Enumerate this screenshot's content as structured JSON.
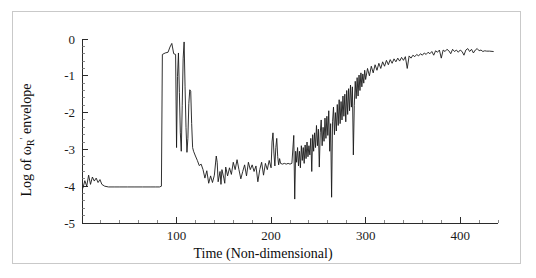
{
  "chart_data": {
    "type": "line",
    "title": "",
    "xlabel": "Time (Non-dimensional)",
    "ylabel": "Log of ωR' envelope",
    "ylabel_parts": {
      "prefix": "Log of ",
      "symbol": "ω",
      "subscript": "R",
      "prime": "'",
      "suffix": " envelope"
    },
    "xlim": [
      0,
      440
    ],
    "ylim": [
      -5,
      0
    ],
    "xticks": [
      100,
      200,
      300,
      400
    ],
    "xticklabels": [
      "100",
      "200",
      "300",
      "400"
    ],
    "yticks": [
      0,
      -1,
      -2,
      -3,
      -4,
      -5
    ],
    "yticklabels": [
      "0",
      "-1",
      "-2",
      "-3",
      "-4",
      "-5"
    ],
    "x_minor_step": 20,
    "y_minor_step": 0.2,
    "grid": false,
    "legend": null,
    "line_color": "#1a1a1a",
    "series": [
      {
        "name": "Log of omega_R prime envelope",
        "points": [
          [
            1,
            -4.05
          ],
          [
            3,
            -3.85
          ],
          [
            5,
            -4.0
          ],
          [
            7,
            -3.7
          ],
          [
            9,
            -3.95
          ],
          [
            11,
            -3.75
          ],
          [
            13,
            -3.86
          ],
          [
            15,
            -3.78
          ],
          [
            17,
            -3.9
          ],
          [
            19,
            -3.82
          ],
          [
            21,
            -3.95
          ],
          [
            24,
            -4.0
          ],
          [
            28,
            -4.02
          ],
          [
            34,
            -4.02
          ],
          [
            40,
            -4.02
          ],
          [
            48,
            -4.02
          ],
          [
            56,
            -4.02
          ],
          [
            64,
            -4.02
          ],
          [
            72,
            -4.02
          ],
          [
            78,
            -4.02
          ],
          [
            82,
            -4.02
          ],
          [
            84,
            -4.0
          ],
          [
            85,
            -0.42
          ],
          [
            88,
            -0.38
          ],
          [
            91,
            -0.36
          ],
          [
            93,
            -0.22
          ],
          [
            95,
            -0.12
          ],
          [
            97,
            -0.4
          ],
          [
            99,
            -0.42
          ],
          [
            100,
            -2.95
          ],
          [
            101,
            -1.02
          ],
          [
            102,
            -0.38
          ],
          [
            103,
            -1.45
          ],
          [
            104,
            -2.55
          ],
          [
            105,
            -3.05
          ],
          [
            106,
            -1.8
          ],
          [
            107,
            -0.52
          ],
          [
            108,
            -0.08
          ],
          [
            109,
            -1.3
          ],
          [
            110,
            -2.4
          ],
          [
            111,
            -3.08
          ],
          [
            112,
            -2.7
          ],
          [
            113,
            -1.75
          ],
          [
            114,
            -1.38
          ],
          [
            115,
            -1.42
          ],
          [
            116,
            -2.3
          ],
          [
            117,
            -2.95
          ],
          [
            118,
            -3.05
          ],
          [
            120,
            -3.18
          ],
          [
            122,
            -3.3
          ],
          [
            124,
            -3.44
          ],
          [
            126,
            -3.4
          ],
          [
            128,
            -3.55
          ],
          [
            130,
            -3.78
          ],
          [
            132,
            -3.58
          ],
          [
            134,
            -3.92
          ],
          [
            136,
            -3.72
          ],
          [
            138,
            -3.9
          ],
          [
            140,
            -3.7
          ],
          [
            142,
            -3.18
          ],
          [
            143,
            -3.35
          ],
          [
            144,
            -3.88
          ],
          [
            146,
            -3.6
          ],
          [
            147,
            -3.95
          ],
          [
            148,
            -3.55
          ],
          [
            150,
            -3.78
          ],
          [
            151,
            -3.92
          ],
          [
            152,
            -3.48
          ],
          [
            154,
            -3.72
          ],
          [
            156,
            -3.5
          ],
          [
            158,
            -3.68
          ],
          [
            160,
            -3.35
          ],
          [
            162,
            -3.55
          ],
          [
            164,
            -3.28
          ],
          [
            166,
            -3.55
          ],
          [
            168,
            -3.8
          ],
          [
            170,
            -3.6
          ],
          [
            172,
            -3.42
          ],
          [
            174,
            -3.72
          ],
          [
            176,
            -3.35
          ],
          [
            178,
            -3.55
          ],
          [
            180,
            -3.42
          ],
          [
            182,
            -3.6
          ],
          [
            184,
            -3.45
          ],
          [
            186,
            -3.88
          ],
          [
            188,
            -3.55
          ],
          [
            190,
            -3.35
          ],
          [
            192,
            -3.7
          ],
          [
            194,
            -3.38
          ],
          [
            196,
            -3.55
          ],
          [
            198,
            -3.3
          ],
          [
            200,
            -3.5
          ],
          [
            201,
            -2.8
          ],
          [
            202,
            -2.55
          ],
          [
            203,
            -3.1
          ],
          [
            204,
            -3.45
          ],
          [
            205,
            -2.95
          ],
          [
            206,
            -2.7
          ],
          [
            207,
            -3.2
          ],
          [
            208,
            -3.42
          ],
          [
            209,
            -3.25
          ],
          [
            210,
            -3.38
          ],
          [
            212,
            -3.4
          ],
          [
            214,
            -3.38
          ],
          [
            216,
            -3.4
          ],
          [
            218,
            -3.38
          ],
          [
            220,
            -3.4
          ],
          [
            222,
            -3.38
          ],
          [
            224,
            -2.62
          ],
          [
            225,
            -4.35
          ],
          [
            226,
            -3.05
          ],
          [
            227,
            -3.35
          ],
          [
            228,
            -2.95
          ],
          [
            229,
            -3.45
          ],
          [
            230,
            -3.05
          ],
          [
            231,
            -3.5
          ],
          [
            232,
            -2.9
          ],
          [
            233,
            -3.3
          ],
          [
            234,
            -2.95
          ],
          [
            235,
            -3.38
          ],
          [
            236,
            -2.88
          ],
          [
            237,
            -3.25
          ],
          [
            238,
            -2.8
          ],
          [
            239,
            -3.2
          ],
          [
            240,
            -2.9
          ],
          [
            241,
            -3.15
          ],
          [
            242,
            -2.7
          ],
          [
            243,
            -3.6
          ],
          [
            244,
            -2.6
          ],
          [
            245,
            -3.05
          ],
          [
            246,
            -2.55
          ],
          [
            247,
            -2.95
          ],
          [
            248,
            -2.35
          ],
          [
            249,
            -2.9
          ],
          [
            250,
            -2.45
          ],
          [
            251,
            -3.48
          ],
          [
            252,
            -2.55
          ],
          [
            253,
            -2.2
          ],
          [
            254,
            -2.9
          ],
          [
            255,
            -2.4
          ],
          [
            256,
            -2.78
          ],
          [
            257,
            -2.15
          ],
          [
            258,
            -2.7
          ],
          [
            259,
            -2.1
          ],
          [
            260,
            -2.62
          ],
          [
            261,
            -1.95
          ],
          [
            262,
            -3.05
          ],
          [
            263,
            -2.3
          ],
          [
            264,
            -4.3
          ],
          [
            265,
            -2.25
          ],
          [
            266,
            -1.85
          ],
          [
            267,
            -2.6
          ],
          [
            268,
            -2.0
          ],
          [
            269,
            -2.5
          ],
          [
            270,
            -1.78
          ],
          [
            271,
            -2.35
          ],
          [
            272,
            -1.65
          ],
          [
            273,
            -2.3
          ],
          [
            274,
            -1.7
          ],
          [
            275,
            -2.2
          ],
          [
            276,
            -1.55
          ],
          [
            277,
            -2.1
          ],
          [
            278,
            -1.5
          ],
          [
            279,
            -2.25
          ],
          [
            280,
            -1.4
          ],
          [
            281,
            -2.05
          ],
          [
            282,
            -1.35
          ],
          [
            283,
            -1.95
          ],
          [
            284,
            -1.25
          ],
          [
            285,
            -1.85
          ],
          [
            286,
            -1.3
          ],
          [
            287,
            -3.15
          ],
          [
            288,
            -1.8
          ],
          [
            289,
            -1.15
          ],
          [
            290,
            -1.62
          ],
          [
            291,
            -1.05
          ],
          [
            292,
            -1.55
          ],
          [
            293,
            -0.98
          ],
          [
            294,
            -1.4
          ],
          [
            295,
            -0.92
          ],
          [
            296,
            -1.3
          ],
          [
            297,
            -0.95
          ],
          [
            298,
            -1.2
          ],
          [
            299,
            -0.85
          ],
          [
            300,
            -1.1
          ],
          [
            302,
            -0.8
          ],
          [
            304,
            -1.0
          ],
          [
            306,
            -0.74
          ],
          [
            308,
            -0.92
          ],
          [
            310,
            -0.7
          ],
          [
            312,
            -0.85
          ],
          [
            314,
            -0.66
          ],
          [
            316,
            -0.8
          ],
          [
            318,
            -0.62
          ],
          [
            320,
            -0.74
          ],
          [
            322,
            -0.58
          ],
          [
            324,
            -0.7
          ],
          [
            326,
            -0.56
          ],
          [
            328,
            -0.66
          ],
          [
            330,
            -0.54
          ],
          [
            332,
            -0.62
          ],
          [
            334,
            -0.52
          ],
          [
            336,
            -0.6
          ],
          [
            338,
            -0.5
          ],
          [
            340,
            -0.58
          ],
          [
            342,
            -0.48
          ],
          [
            344,
            -0.8
          ],
          [
            346,
            -0.46
          ],
          [
            348,
            -0.52
          ],
          [
            350,
            -0.44
          ],
          [
            352,
            -0.48
          ],
          [
            354,
            -0.42
          ],
          [
            356,
            -0.46
          ],
          [
            358,
            -0.4
          ],
          [
            360,
            -0.44
          ],
          [
            362,
            -0.38
          ],
          [
            364,
            -0.42
          ],
          [
            366,
            -0.36
          ],
          [
            368,
            -0.4
          ],
          [
            370,
            -0.34
          ],
          [
            372,
            -0.44
          ],
          [
            374,
            -0.32
          ],
          [
            376,
            -0.36
          ],
          [
            378,
            -0.3
          ],
          [
            380,
            -0.52
          ],
          [
            382,
            -0.3
          ],
          [
            384,
            -0.34
          ],
          [
            386,
            -0.28
          ],
          [
            388,
            -0.32
          ],
          [
            390,
            -0.4
          ],
          [
            392,
            -0.28
          ],
          [
            394,
            -0.34
          ],
          [
            396,
            -0.3
          ],
          [
            398,
            -0.36
          ],
          [
            400,
            -0.3
          ],
          [
            402,
            -0.34
          ],
          [
            404,
            -0.44
          ],
          [
            406,
            -0.3
          ],
          [
            408,
            -0.26
          ],
          [
            410,
            -0.34
          ],
          [
            412,
            -0.28
          ],
          [
            414,
            -0.38
          ],
          [
            416,
            -0.3
          ],
          [
            418,
            -0.26
          ],
          [
            420,
            -0.32
          ],
          [
            422,
            -0.3
          ],
          [
            424,
            -0.34
          ],
          [
            426,
            -0.32
          ],
          [
            428,
            -0.33
          ],
          [
            431,
            -0.33
          ],
          [
            435,
            -0.34
          ]
        ]
      }
    ]
  }
}
